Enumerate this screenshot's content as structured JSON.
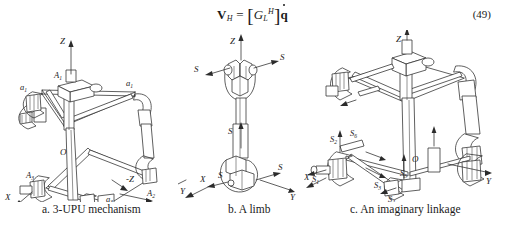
{
  "equation": {
    "lhs_vector": "V",
    "lhs_subscript": "H",
    "equals": "=",
    "matrix_symbol": "G",
    "matrix_subscript": "L",
    "matrix_superscript": "H",
    "rhs_vector": "q",
    "number": "(49)",
    "plain_text": "V_H = [ G_L^H ] q̇"
  },
  "figure": {
    "panels": [
      {
        "id": "a",
        "caption": "a.  3-UPU mechanism",
        "axes": {
          "x": "X",
          "y": "Y",
          "z": "Z",
          "origin": "O"
        },
        "joint_labels": [
          "A1",
          "A2",
          "A3",
          "a1",
          "a2",
          "a3"
        ],
        "axis_negative_z": "-Z"
      },
      {
        "id": "b",
        "caption": "b. A limb",
        "axes": {
          "x": "X",
          "y": "Y",
          "z": "Z"
        },
        "screw_labels": [
          "S",
          "S",
          "S",
          "S",
          "S"
        ]
      },
      {
        "id": "c",
        "caption": "c.  An imaginary linkage",
        "axes": {
          "x": "X",
          "y": "Y",
          "z": "Z",
          "origin": "O"
        },
        "screw_labels": [
          "S1",
          "S2",
          "S3",
          "S4",
          "S5",
          "S6"
        ]
      }
    ]
  },
  "style": {
    "background": "#ffffff",
    "ink": "#2b2b2b",
    "text": "#1a1a1a"
  }
}
